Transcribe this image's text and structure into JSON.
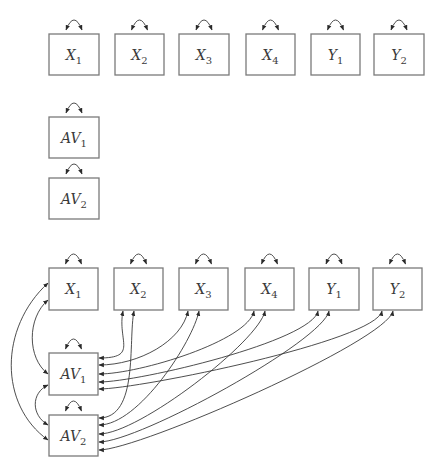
{
  "colors": {
    "box_stroke": "#7a7a7a",
    "line": "#3a3a3a",
    "text": "#3a3a3a",
    "background": "#ffffff"
  },
  "top_model": {
    "nodes": [
      {
        "id": "X1",
        "var": "X",
        "sub": "1",
        "x": 49,
        "y": 34,
        "w": 50,
        "h": 41
      },
      {
        "id": "X2",
        "var": "X",
        "sub": "2",
        "x": 115,
        "y": 34,
        "w": 49,
        "h": 41
      },
      {
        "id": "X3",
        "var": "X",
        "sub": "3",
        "x": 179,
        "y": 34,
        "w": 50,
        "h": 41
      },
      {
        "id": "X4",
        "var": "X",
        "sub": "4",
        "x": 246,
        "y": 34,
        "w": 49,
        "h": 41
      },
      {
        "id": "Y1",
        "var": "Y",
        "sub": "1",
        "x": 311,
        "y": 34,
        "w": 49,
        "h": 41
      },
      {
        "id": "Y2",
        "var": "Y",
        "sub": "2",
        "x": 374,
        "y": 34,
        "w": 50,
        "h": 41
      },
      {
        "id": "AV1",
        "var": "AV",
        "sub": "1",
        "x": 49,
        "y": 117,
        "w": 50,
        "h": 41
      },
      {
        "id": "AV2",
        "var": "AV",
        "sub": "2",
        "x": 49,
        "y": 178,
        "w": 50,
        "h": 41
      }
    ],
    "variances": [
      "X1",
      "X2",
      "X3",
      "X4",
      "Y1",
      "Y2",
      "AV1",
      "AV2"
    ],
    "covariances": []
  },
  "bottom_model": {
    "nodes": [
      {
        "id": "X1",
        "var": "X",
        "sub": "1",
        "x": 49,
        "y": 268,
        "w": 49,
        "h": 42
      },
      {
        "id": "X2",
        "var": "X",
        "sub": "2",
        "x": 114,
        "y": 268,
        "w": 49,
        "h": 42
      },
      {
        "id": "X3",
        "var": "X",
        "sub": "3",
        "x": 179,
        "y": 268,
        "w": 49,
        "h": 42
      },
      {
        "id": "X4",
        "var": "X",
        "sub": "4",
        "x": 245,
        "y": 268,
        "w": 49,
        "h": 42
      },
      {
        "id": "Y1",
        "var": "Y",
        "sub": "1",
        "x": 309,
        "y": 268,
        "w": 50,
        "h": 42
      },
      {
        "id": "Y2",
        "var": "Y",
        "sub": "2",
        "x": 373,
        "y": 268,
        "w": 49,
        "h": 42
      },
      {
        "id": "AV1",
        "var": "AV",
        "sub": "1",
        "x": 49,
        "y": 353,
        "w": 49,
        "h": 42
      },
      {
        "id": "AV2",
        "var": "AV",
        "sub": "2",
        "x": 49,
        "y": 415,
        "w": 49,
        "h": 41
      }
    ],
    "variances": [
      "X1",
      "X2",
      "X3",
      "X4",
      "Y1",
      "Y2",
      "AV1",
      "AV2"
    ],
    "covariances": [
      [
        "X1",
        "AV1"
      ],
      [
        "X1",
        "AV2"
      ],
      [
        "AV1",
        "AV2"
      ],
      [
        "X2",
        "AV1"
      ],
      [
        "X2",
        "AV2"
      ],
      [
        "X3",
        "AV1"
      ],
      [
        "X3",
        "AV2"
      ],
      [
        "X4",
        "AV1"
      ],
      [
        "X4",
        "AV2"
      ],
      [
        "Y1",
        "AV1"
      ],
      [
        "Y1",
        "AV2"
      ],
      [
        "Y2",
        "AV1"
      ],
      [
        "Y2",
        "AV2"
      ]
    ]
  }
}
